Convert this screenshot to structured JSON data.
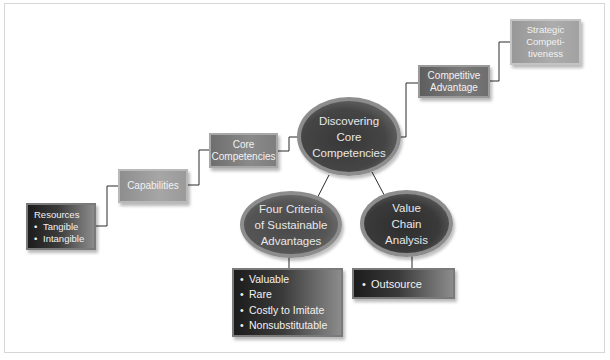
{
  "diagram": {
    "title_path": [
      "Resources",
      "Capabilities",
      "Core Competencies",
      "Discovering Core Competencies",
      "Competitive Advantage",
      "Strategic Competitiveness"
    ],
    "resources": {
      "heading": "Resources",
      "items": [
        "Tangible",
        "Intangible"
      ]
    },
    "capabilities": {
      "label": "Capabilities"
    },
    "core_competencies": {
      "line1": "Core",
      "line2": "Competencies"
    },
    "discovering": {
      "line1": "Discovering",
      "line2": "Core",
      "line3": "Competencies"
    },
    "competitive_advantage": {
      "line1": "Competitive",
      "line2": "Advantage"
    },
    "strategic_competitiveness": {
      "line1": "Strategic",
      "line2": "Competi-",
      "line3": "tiveness"
    },
    "four_criteria": {
      "line1": "Four Criteria",
      "line2": "of Sustainable",
      "line3": "Advantages",
      "items": [
        "Valuable",
        "Rare",
        "Costly to Imitate",
        "Nonsubstitutable"
      ]
    },
    "value_chain": {
      "line1": "Value",
      "line2": "Chain",
      "line3": "Analysis",
      "items": [
        "Outsource"
      ]
    },
    "colors": {
      "step_box": "#9c9c9c",
      "step_box_mid": "#7f7f7f",
      "dark_box": "#2a2a2a",
      "ellipse": "#3d3d3d",
      "connector": "#2b2b2b",
      "frame": "#d6d6d6"
    }
  }
}
